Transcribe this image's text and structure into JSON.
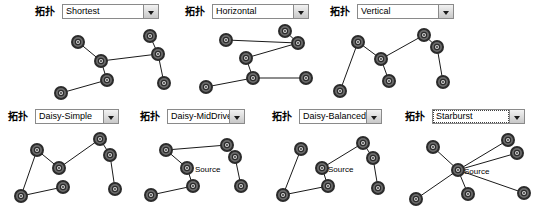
{
  "window": {
    "background": "#ffffff",
    "node_fill": "#6b6b6b",
    "node_ring": "#2b2b2b",
    "node_center": "#d8d8d8",
    "edge_color": "#1a1a1a"
  },
  "combo_label_text": "拓扑",
  "panels": [
    {
      "id": "shortest",
      "name": "Shortest",
      "combo": {
        "label": "拓扑",
        "value": "Shortest",
        "focused": false
      },
      "nodes": [
        {
          "x": 78,
          "y": 42
        },
        {
          "x": 101,
          "y": 61
        },
        {
          "x": 107,
          "y": 80
        },
        {
          "x": 61,
          "y": 93
        },
        {
          "x": 150,
          "y": 36
        },
        {
          "x": 158,
          "y": 54
        },
        {
          "x": 164,
          "y": 83
        }
      ],
      "edges": [
        [
          0,
          1
        ],
        [
          1,
          2
        ],
        [
          2,
          3
        ],
        [
          1,
          5
        ],
        [
          4,
          5
        ],
        [
          5,
          6
        ]
      ],
      "labels": []
    },
    {
      "id": "horizontal",
      "name": "Horizontal",
      "combo": {
        "label": "拓扑",
        "value": "Horizontal",
        "focused": false
      },
      "nodes": [
        {
          "x": 46,
          "y": 40
        },
        {
          "x": 66,
          "y": 58
        },
        {
          "x": 73,
          "y": 78
        },
        {
          "x": 26,
          "y": 87
        },
        {
          "x": 105,
          "y": 31
        },
        {
          "x": 118,
          "y": 43
        },
        {
          "x": 126,
          "y": 78
        }
      ],
      "edges": [
        [
          0,
          5
        ],
        [
          1,
          5
        ],
        [
          1,
          2
        ],
        [
          2,
          3
        ],
        [
          4,
          5
        ],
        [
          2,
          6
        ]
      ],
      "labels": []
    },
    {
      "id": "vertical",
      "name": "Vertical",
      "combo": {
        "label": "拓扑",
        "value": "Vertical",
        "focused": false
      },
      "nodes": [
        {
          "x": 33,
          "y": 42
        },
        {
          "x": 56,
          "y": 59
        },
        {
          "x": 64,
          "y": 81
        },
        {
          "x": 15,
          "y": 91
        },
        {
          "x": 99,
          "y": 35
        },
        {
          "x": 112,
          "y": 47
        },
        {
          "x": 118,
          "y": 82
        }
      ],
      "edges": [
        [
          0,
          1
        ],
        [
          0,
          3
        ],
        [
          1,
          2
        ],
        [
          1,
          4
        ],
        [
          4,
          5
        ],
        [
          5,
          6
        ]
      ],
      "labels": []
    },
    {
      "id": "daisy-simple",
      "name": "Daisy-Simple",
      "combo": {
        "label": "拓扑",
        "value": "Daisy-Simple",
        "focused": false
      },
      "nodes": [
        {
          "x": 37,
          "y": 45
        },
        {
          "x": 59,
          "y": 63
        },
        {
          "x": 63,
          "y": 82
        },
        {
          "x": 21,
          "y": 91
        },
        {
          "x": 100,
          "y": 34
        },
        {
          "x": 110,
          "y": 50
        },
        {
          "x": 115,
          "y": 84
        }
      ],
      "edges": [
        [
          0,
          1
        ],
        [
          0,
          3
        ],
        [
          1,
          4
        ],
        [
          2,
          3
        ],
        [
          4,
          5
        ],
        [
          5,
          6
        ]
      ],
      "labels": []
    },
    {
      "id": "daisy-middriven",
      "name": "Daisy-MidDriven",
      "combo": {
        "label": "拓扑",
        "value": "Daisy-MidDriven",
        "focused": false
      },
      "nodes": [
        {
          "x": 31,
          "y": 45
        },
        {
          "x": 52,
          "y": 63
        },
        {
          "x": 58,
          "y": 81
        },
        {
          "x": 16,
          "y": 90
        },
        {
          "x": 92,
          "y": 40
        },
        {
          "x": 100,
          "y": 52
        },
        {
          "x": 106,
          "y": 81
        }
      ],
      "edges": [
        [
          0,
          1
        ],
        [
          0,
          4
        ],
        [
          1,
          2
        ],
        [
          2,
          3
        ],
        [
          4,
          5
        ],
        [
          5,
          6
        ]
      ],
      "labels": [
        {
          "text": "Source",
          "x": 60,
          "y": 60
        }
      ]
    },
    {
      "id": "daisy-balanced",
      "name": "Daisy-Balanced",
      "combo": {
        "label": "拓扑",
        "value": "Daisy-Balanced",
        "focused": false
      },
      "nodes": [
        {
          "x": 31,
          "y": 44
        },
        {
          "x": 52,
          "y": 63
        },
        {
          "x": 58,
          "y": 81
        },
        {
          "x": 13,
          "y": 90
        },
        {
          "x": 93,
          "y": 38
        },
        {
          "x": 103,
          "y": 53
        },
        {
          "x": 108,
          "y": 83
        }
      ],
      "edges": [
        [
          0,
          3
        ],
        [
          1,
          4
        ],
        [
          1,
          2
        ],
        [
          2,
          3
        ],
        [
          4,
          5
        ],
        [
          5,
          6
        ]
      ],
      "labels": [
        {
          "text": "Source",
          "x": 58,
          "y": 60
        }
      ]
    },
    {
      "id": "starburst",
      "name": "Starburst",
      "combo": {
        "label": "拓扑",
        "value": "Starburst",
        "focused": true
      },
      "nodes": [
        {
          "x": 58,
          "y": 65
        },
        {
          "x": 33,
          "y": 42
        },
        {
          "x": 108,
          "y": 35
        },
        {
          "x": 117,
          "y": 48
        },
        {
          "x": 16,
          "y": 94
        },
        {
          "x": 68,
          "y": 89
        },
        {
          "x": 124,
          "y": 88
        }
      ],
      "edges": [
        [
          0,
          1
        ],
        [
          0,
          2
        ],
        [
          0,
          3
        ],
        [
          0,
          4
        ],
        [
          0,
          5
        ],
        [
          0,
          6
        ]
      ],
      "labels": [
        {
          "text": "Source",
          "x": 64,
          "y": 62
        }
      ]
    }
  ]
}
